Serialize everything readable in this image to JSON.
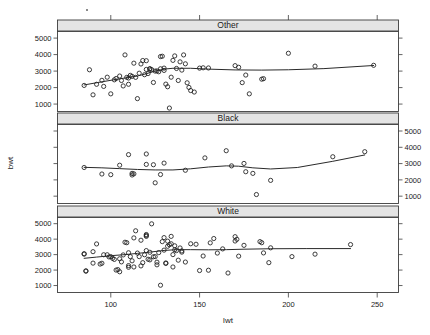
{
  "figure": {
    "title": "",
    "xlabel": "lwt",
    "ylabel": "bwt",
    "panel_variable": "race"
  },
  "strips": [
    {
      "label": "Other"
    },
    {
      "label": "Black"
    },
    {
      "label": "White"
    }
  ],
  "axes": {
    "x_ticks": [
      100,
      150,
      200,
      250
    ],
    "x_tick_labels": [
      "100",
      "150",
      "200",
      "250"
    ],
    "y_ticks": [
      1000,
      2000,
      3000,
      4000,
      5000
    ],
    "y_tick_labels": [
      "1000",
      "2000",
      "3000",
      "4000",
      "5000"
    ],
    "xlim": [
      70,
      262
    ],
    "ylim": [
      550,
      5400
    ],
    "left_labeled_panels": [
      0,
      2
    ],
    "right_labeled_panels": [
      1
    ]
  },
  "chart_data": {
    "type": "scatter",
    "title": "",
    "xlabel": "lwt",
    "ylabel": "bwt",
    "xlim": [
      70,
      262
    ],
    "ylim": [
      550,
      5400
    ],
    "grid": false,
    "legend": "none",
    "conditioning": "race",
    "panels": [
      {
        "name": "Other",
        "points": [
          [
            85,
            2130
          ],
          [
            88,
            3080
          ],
          [
            90,
            1560
          ],
          [
            92,
            2200
          ],
          [
            95,
            2440
          ],
          [
            96,
            2070
          ],
          [
            98,
            2630
          ],
          [
            100,
            1620
          ],
          [
            102,
            2470
          ],
          [
            103,
            2550
          ],
          [
            105,
            2700
          ],
          [
            106,
            2430
          ],
          [
            107,
            2100
          ],
          [
            108,
            3980
          ],
          [
            109,
            2620
          ],
          [
            110,
            2580
          ],
          [
            110,
            2200
          ],
          [
            111,
            2740
          ],
          [
            112,
            2680
          ],
          [
            113,
            3480
          ],
          [
            114,
            2620
          ],
          [
            115,
            1330
          ],
          [
            116,
            2870
          ],
          [
            117,
            3430
          ],
          [
            118,
            3640
          ],
          [
            119,
            2780
          ],
          [
            120,
            3100
          ],
          [
            120,
            3630
          ],
          [
            121,
            2850
          ],
          [
            122,
            3150
          ],
          [
            122,
            3120
          ],
          [
            123,
            3090
          ],
          [
            124,
            2310
          ],
          [
            125,
            3000
          ],
          [
            126,
            3010
          ],
          [
            127,
            2960
          ],
          [
            128,
            3140
          ],
          [
            128,
            3880
          ],
          [
            129,
            3900
          ],
          [
            130,
            3180
          ],
          [
            130,
            3040
          ],
          [
            131,
            2210
          ],
          [
            132,
            2050
          ],
          [
            133,
            760
          ],
          [
            134,
            2630
          ],
          [
            135,
            3650
          ],
          [
            136,
            3920
          ],
          [
            137,
            3160
          ],
          [
            138,
            2430
          ],
          [
            139,
            3560
          ],
          [
            140,
            3060
          ],
          [
            141,
            3980
          ],
          [
            142,
            3440
          ],
          [
            143,
            2290
          ],
          [
            144,
            2010
          ],
          [
            145,
            1820
          ],
          [
            147,
            1730
          ],
          [
            150,
            3180
          ],
          [
            152,
            3200
          ],
          [
            155,
            3190
          ],
          [
            170,
            3330
          ],
          [
            172,
            3230
          ],
          [
            174,
            2300
          ],
          [
            176,
            2760
          ],
          [
            178,
            1620
          ],
          [
            185,
            2510
          ],
          [
            186,
            2540
          ],
          [
            200,
            4080
          ],
          [
            215,
            3300
          ],
          [
            248,
            3350
          ]
        ],
        "smooth": [
          [
            85,
            2160
          ],
          [
            95,
            2350
          ],
          [
            105,
            2530
          ],
          [
            115,
            2700
          ],
          [
            120,
            2840
          ],
          [
            125,
            3000
          ],
          [
            130,
            3120
          ],
          [
            135,
            3170
          ],
          [
            145,
            3170
          ],
          [
            155,
            3120
          ],
          [
            170,
            3070
          ],
          [
            185,
            3060
          ],
          [
            200,
            3080
          ],
          [
            220,
            3150
          ],
          [
            248,
            3340
          ]
        ]
      },
      {
        "name": "Black",
        "points": [
          [
            85,
            2760
          ],
          [
            95,
            2360
          ],
          [
            100,
            2320
          ],
          [
            105,
            2900
          ],
          [
            110,
            3550
          ],
          [
            112,
            2400
          ],
          [
            112,
            2300
          ],
          [
            113,
            2370
          ],
          [
            120,
            3590
          ],
          [
            120,
            2950
          ],
          [
            124,
            2930
          ],
          [
            125,
            1820
          ],
          [
            128,
            2330
          ],
          [
            130,
            3030
          ],
          [
            142,
            2590
          ],
          [
            153,
            3350
          ],
          [
            165,
            3790
          ],
          [
            168,
            2860
          ],
          [
            175,
            3010
          ],
          [
            176,
            2500
          ],
          [
            180,
            2400
          ],
          [
            182,
            1100
          ],
          [
            190,
            1970
          ],
          [
            225,
            3420
          ],
          [
            243,
            3730
          ]
        ],
        "smooth": [
          [
            85,
            2770
          ],
          [
            95,
            2740
          ],
          [
            105,
            2690
          ],
          [
            115,
            2640
          ],
          [
            125,
            2610
          ],
          [
            135,
            2610
          ],
          [
            145,
            2680
          ],
          [
            155,
            2790
          ],
          [
            165,
            2860
          ],
          [
            172,
            2840
          ],
          [
            180,
            2740
          ],
          [
            190,
            2670
          ],
          [
            205,
            2760
          ],
          [
            225,
            3140
          ],
          [
            243,
            3530
          ]
        ]
      },
      {
        "name": "White",
        "points": [
          [
            85,
            3060
          ],
          [
            85,
            3030
          ],
          [
            86,
            1930
          ],
          [
            86,
            1950
          ],
          [
            90,
            3190
          ],
          [
            90,
            2450
          ],
          [
            92,
            3690
          ],
          [
            94,
            2390
          ],
          [
            95,
            2440
          ],
          [
            96,
            2990
          ],
          [
            98,
            2990
          ],
          [
            99,
            2850
          ],
          [
            100,
            2870
          ],
          [
            101,
            2760
          ],
          [
            102,
            2690
          ],
          [
            103,
            2000
          ],
          [
            104,
            2030
          ],
          [
            105,
            2730
          ],
          [
            105,
            1890
          ],
          [
            106,
            2530
          ],
          [
            107,
            2980
          ],
          [
            108,
            3800
          ],
          [
            109,
            3770
          ],
          [
            110,
            2290
          ],
          [
            110,
            2180
          ],
          [
            110,
            3120
          ],
          [
            111,
            2870
          ],
          [
            112,
            2600
          ],
          [
            113,
            2200
          ],
          [
            113,
            4080
          ],
          [
            114,
            4540
          ],
          [
            115,
            3100
          ],
          [
            116,
            2870
          ],
          [
            117,
            3930
          ],
          [
            117,
            2270
          ],
          [
            118,
            2480
          ],
          [
            119,
            2990
          ],
          [
            120,
            3260
          ],
          [
            120,
            4240
          ],
          [
            120,
            4300
          ],
          [
            120,
            4180
          ],
          [
            121,
            2700
          ],
          [
            122,
            2660
          ],
          [
            122,
            3150
          ],
          [
            123,
            4990
          ],
          [
            124,
            2860
          ],
          [
            125,
            2870
          ],
          [
            126,
            2510
          ],
          [
            126,
            2340
          ],
          [
            127,
            3130
          ],
          [
            128,
            1020
          ],
          [
            129,
            3840
          ],
          [
            130,
            4100
          ],
          [
            130,
            3290
          ],
          [
            131,
            2430
          ],
          [
            131,
            2460
          ],
          [
            132,
            3870
          ],
          [
            132,
            3540
          ],
          [
            133,
            3640
          ],
          [
            134,
            3700
          ],
          [
            134,
            4180
          ],
          [
            135,
            3000
          ],
          [
            135,
            2200
          ],
          [
            136,
            3570
          ],
          [
            136,
            3310
          ],
          [
            137,
            3260
          ],
          [
            138,
            2640
          ],
          [
            139,
            3430
          ],
          [
            140,
            3160
          ],
          [
            140,
            3240
          ],
          [
            142,
            2520
          ],
          [
            145,
            3700
          ],
          [
            148,
            3670
          ],
          [
            150,
            1970
          ],
          [
            152,
            2910
          ],
          [
            155,
            1990
          ],
          [
            156,
            3760
          ],
          [
            158,
            4040
          ],
          [
            160,
            3100
          ],
          [
            163,
            3370
          ],
          [
            166,
            1810
          ],
          [
            170,
            4160
          ],
          [
            170,
            3880
          ],
          [
            171,
            3990
          ],
          [
            172,
            2900
          ],
          [
            175,
            3600
          ],
          [
            184,
            3840
          ],
          [
            185,
            3770
          ],
          [
            186,
            3110
          ],
          [
            189,
            2480
          ],
          [
            190,
            3440
          ],
          [
            202,
            2870
          ],
          [
            215,
            3030
          ],
          [
            235,
            3650
          ]
        ],
        "smooth": [
          [
            85,
            2760
          ],
          [
            92,
            2840
          ],
          [
            100,
            2930
          ],
          [
            108,
            3000
          ],
          [
            115,
            3080
          ],
          [
            122,
            3160
          ],
          [
            130,
            3270
          ],
          [
            137,
            3320
          ],
          [
            145,
            3320
          ],
          [
            155,
            3310
          ],
          [
            165,
            3320
          ],
          [
            175,
            3350
          ],
          [
            190,
            3380
          ],
          [
            210,
            3390
          ],
          [
            235,
            3390
          ]
        ]
      }
    ]
  }
}
